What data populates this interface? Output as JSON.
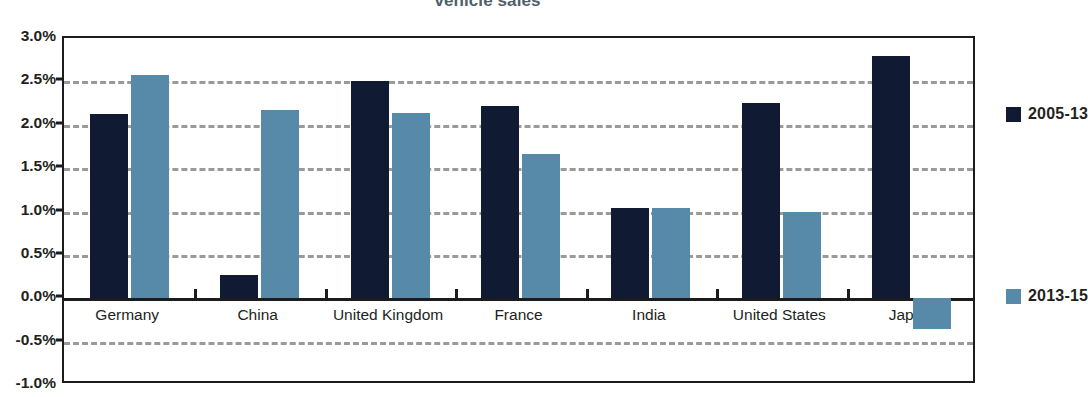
{
  "chart_data": {
    "type": "bar",
    "title": "vehicle sales",
    "title_note": "Title is cropped at the top edge of the screenshot; only the words 'vehicle sales' are visible.",
    "xlabel": "",
    "ylabel": "",
    "ylim": [
      -1.0,
      3.0
    ],
    "ytick_step": 0.5,
    "ytick_labels": [
      "3.0%",
      "2.5%",
      "2.0%",
      "1.5%",
      "1.0%",
      "0.5%",
      "0.0%",
      "-0.5%",
      "-1.0%"
    ],
    "ytick_values": [
      3.0,
      2.5,
      2.0,
      1.5,
      1.0,
      0.5,
      0.0,
      -0.5,
      -1.0
    ],
    "grid": true,
    "grid_style": "dashed-horizontal",
    "legend_position": "right",
    "categories": [
      "Germany",
      "China",
      "United Kingdom",
      "France",
      "India",
      "United States",
      "Japan"
    ],
    "series": [
      {
        "name": "2005-13",
        "color": "#111a33",
        "values": [
          2.12,
          0.27,
          2.5,
          2.22,
          1.04,
          2.25,
          2.79
        ]
      },
      {
        "name": "2013-15",
        "color": "#5789a8",
        "values": [
          2.57,
          2.17,
          2.14,
          1.66,
          1.04,
          0.99,
          -0.35
        ]
      }
    ],
    "units": "percent"
  },
  "legend": {
    "entries": [
      {
        "label": "2005-13",
        "color": "#111a33"
      },
      {
        "label": "2013-15",
        "color": "#5789a8"
      }
    ]
  },
  "colors": {
    "series_a": "#111a33",
    "series_b": "#5789a8",
    "axis": "#1c1c1c",
    "grid": "#9a9a9a",
    "title_text": "#4e6168",
    "label_text": "#231f20",
    "background": "#ffffff"
  }
}
